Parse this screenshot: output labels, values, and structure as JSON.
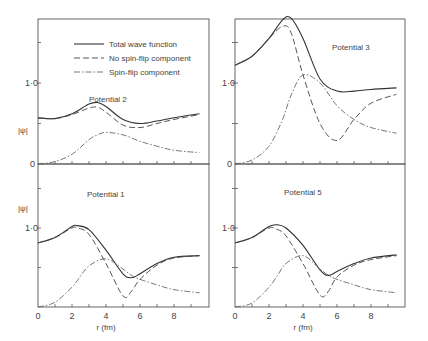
{
  "figure": {
    "legend": {
      "total": "Total wave function",
      "nsf": "No spin-flip component",
      "sf": "Spin-flip component"
    },
    "ylabel": "|ψ|",
    "xlabel": "r (fm)",
    "xticks": [
      "0",
      "2",
      "4",
      "6",
      "8"
    ],
    "yticks": {
      "zero": "0",
      "one": "1·0"
    }
  },
  "chart_data": [
    {
      "type": "line",
      "title": "Potential 2",
      "xlabel": "r (fm)",
      "ylabel": "|ψ|",
      "xlim": [
        0,
        10
      ],
      "ylim": [
        0,
        1.8
      ],
      "x": [
        0,
        1,
        2,
        3,
        3.5,
        4,
        5,
        6,
        7,
        8,
        9.5
      ],
      "series": [
        {
          "name": "Total wave function",
          "values": [
            0.57,
            0.56,
            0.62,
            0.74,
            0.76,
            0.71,
            0.55,
            0.5,
            0.53,
            0.57,
            0.62
          ]
        },
        {
          "name": "No spin-flip component",
          "values": [
            0.57,
            0.56,
            0.61,
            0.69,
            0.7,
            0.64,
            0.48,
            0.45,
            0.5,
            0.55,
            0.61
          ]
        },
        {
          "name": "Spin-flip component",
          "values": [
            0.0,
            0.03,
            0.12,
            0.3,
            0.36,
            0.39,
            0.36,
            0.28,
            0.22,
            0.17,
            0.14
          ]
        }
      ]
    },
    {
      "type": "line",
      "title": "Potential 3",
      "xlabel": "r (fm)",
      "ylabel": "|ψ|",
      "xlim": [
        0,
        10
      ],
      "ylim": [
        0,
        1.8
      ],
      "x": [
        0,
        1,
        2,
        2.8,
        3.3,
        4,
        5,
        6,
        7,
        8,
        9.5
      ],
      "series": [
        {
          "name": "Total wave function",
          "values": [
            1.22,
            1.33,
            1.55,
            1.78,
            1.8,
            1.55,
            1.05,
            0.9,
            0.9,
            0.92,
            0.94
          ]
        },
        {
          "name": "No spin-flip component",
          "values": [
            1.22,
            1.33,
            1.55,
            1.7,
            1.62,
            1.1,
            0.5,
            0.29,
            0.55,
            0.75,
            0.86
          ]
        },
        {
          "name": "Spin-flip component",
          "values": [
            0.0,
            0.05,
            0.22,
            0.55,
            0.85,
            1.1,
            1.0,
            0.72,
            0.55,
            0.45,
            0.38
          ]
        }
      ]
    },
    {
      "type": "line",
      "title": "Potential 1",
      "xlabel": "r (fm)",
      "ylabel": "|ψ|",
      "xlim": [
        0,
        10
      ],
      "ylim": [
        0,
        1.6
      ],
      "x": [
        0,
        1,
        2,
        2.3,
        3,
        4,
        5,
        5.5,
        6,
        7,
        8,
        9.5
      ],
      "series": [
        {
          "name": "Total wave function",
          "values": [
            0.81,
            0.88,
            1.02,
            1.03,
            0.98,
            0.72,
            0.42,
            0.37,
            0.42,
            0.55,
            0.63,
            0.65
          ]
        },
        {
          "name": "No spin-flip component",
          "values": [
            0.81,
            0.88,
            1.0,
            1.0,
            0.92,
            0.55,
            0.14,
            0.2,
            0.35,
            0.53,
            0.62,
            0.65
          ]
        },
        {
          "name": "Spin-flip component",
          "values": [
            0.0,
            0.06,
            0.25,
            0.33,
            0.52,
            0.61,
            0.48,
            0.4,
            0.35,
            0.28,
            0.22,
            0.18
          ]
        }
      ]
    },
    {
      "type": "line",
      "title": "Potential 5",
      "xlabel": "r (fm)",
      "ylabel": "|ψ|",
      "xlim": [
        0,
        10
      ],
      "ylim": [
        0,
        1.6
      ],
      "x": [
        0,
        1,
        2,
        2.5,
        3,
        4,
        5,
        5.5,
        6,
        7,
        8,
        9.5
      ],
      "series": [
        {
          "name": "Total wave function",
          "values": [
            0.81,
            0.88,
            1.02,
            1.04,
            1.0,
            0.78,
            0.47,
            0.4,
            0.45,
            0.55,
            0.62,
            0.66
          ]
        },
        {
          "name": "No spin-flip component",
          "values": [
            0.81,
            0.88,
            1.0,
            0.98,
            0.9,
            0.55,
            0.15,
            0.2,
            0.38,
            0.53,
            0.6,
            0.65
          ]
        },
        {
          "name": "Spin-flip component",
          "values": [
            0.0,
            0.05,
            0.25,
            0.4,
            0.55,
            0.65,
            0.48,
            0.4,
            0.35,
            0.28,
            0.22,
            0.18
          ]
        }
      ]
    }
  ]
}
